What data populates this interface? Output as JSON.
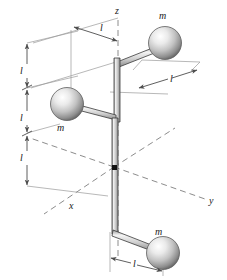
{
  "figure": {
    "background_color": "#ffffff",
    "line_color": "#4d4d4d",
    "dash_color": "#8c8c8c",
    "rod_outline_color": "#3a3a3a",
    "rod_fill_color": "#e8e8e8",
    "sphere_light_color": "#ffffff",
    "sphere_mid_color": "#c6c6c6",
    "sphere_dark_color": "#6e6e6e"
  },
  "axes": [
    {
      "name": "z-axis",
      "label": "z",
      "x": 118,
      "y": 10,
      "style": "dashed-vertical"
    },
    {
      "name": "y-axis",
      "label": "y",
      "x": 212,
      "y": 201,
      "style": "dashed-oblique-right"
    },
    {
      "name": "x-axis",
      "label": "x",
      "x": 72,
      "y": 205,
      "style": "dashed-oblique-left"
    }
  ],
  "origin": {
    "name": "origin-marker",
    "x": 114,
    "y": 167
  },
  "masses": [
    {
      "id": "mass-top",
      "label": "m",
      "label_x": 160,
      "label_y": 16,
      "cx": 165,
      "cy": 43,
      "r": 16
    },
    {
      "id": "mass-middle",
      "label": "m",
      "label_x": 58,
      "label_y": 128,
      "cx": 67,
      "cy": 104,
      "r": 16
    },
    {
      "id": "mass-bottom",
      "label": "m",
      "label_x": 156,
      "label_y": 232,
      "cx": 163,
      "cy": 253,
      "r": 16
    }
  ],
  "dimensions": [
    {
      "id": "dim-top-horizontal",
      "label": "l",
      "label_x": 93,
      "label_y": 33,
      "orientation": "oblique"
    },
    {
      "id": "dim-upper-right",
      "label": "l",
      "label_x": 172,
      "label_y": 79,
      "orientation": "oblique"
    },
    {
      "id": "dim-bottom-horizontal",
      "label": "l",
      "label_x": 133,
      "label_y": 263,
      "orientation": "oblique"
    },
    {
      "id": "dim-vertical-upper",
      "label": "l",
      "label_x": 22,
      "label_y": 71,
      "orientation": "vertical"
    },
    {
      "id": "dim-vertical-middle",
      "label": "l",
      "label_x": 22,
      "label_y": 118,
      "orientation": "vertical"
    },
    {
      "id": "dim-vertical-lower",
      "label": "l",
      "label_x": 22,
      "label_y": 158,
      "orientation": "vertical"
    }
  ],
  "rod_path": {
    "name": "bent-rod",
    "segments": [
      "top arm from z-axis elbow out to top mass",
      "vertical drop from top elbow down to middle elbow",
      "middle arm from vertical rod out to middle mass",
      "vertical rod through origin down to bottom elbow",
      "bottom arm from bottom elbow out to bottom mass"
    ]
  }
}
